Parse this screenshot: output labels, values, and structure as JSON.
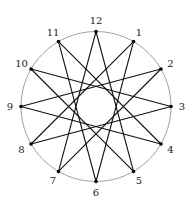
{
  "diagram": {
    "type": "star-polygon",
    "notation": "{12/5}",
    "center": [
      96,
      106.5
    ],
    "radius": 75,
    "step": 5,
    "colors": {
      "circle": "#888888",
      "edge": "#111111",
      "vertex": "#000000",
      "label": "#222222"
    },
    "vertices": [
      {
        "label": "12"
      },
      {
        "label": "1"
      },
      {
        "label": "2"
      },
      {
        "label": "3"
      },
      {
        "label": "4"
      },
      {
        "label": "5"
      },
      {
        "label": "6"
      },
      {
        "label": "7"
      },
      {
        "label": "8"
      },
      {
        "label": "9"
      },
      {
        "label": "10"
      },
      {
        "label": "11"
      }
    ]
  }
}
